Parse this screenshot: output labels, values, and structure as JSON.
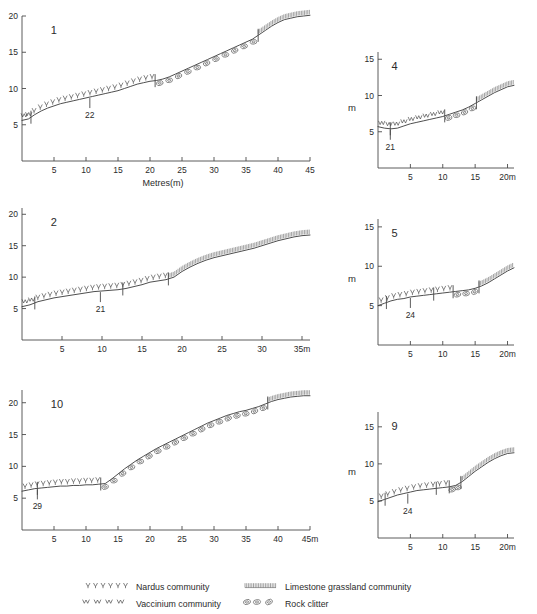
{
  "figure": {
    "axis_title": "Metres(m)",
    "vertical_unit": "m"
  },
  "legend": {
    "items": [
      {
        "symbol": "nardus-symbol",
        "label": "Nardus community"
      },
      {
        "symbol": "vaccinium-symbol",
        "label": "Vaccinium community"
      },
      {
        "symbol": "limestone-symbol",
        "label": "Limestone grassland community"
      },
      {
        "symbol": "clitter-symbol",
        "label": "Rock clitter"
      }
    ]
  },
  "chart_data": {
    "type": "line",
    "xlabel": "Metres(m)",
    "ylabel": "m",
    "grid": false,
    "legend_position": "bottom",
    "panels": [
      {
        "id": "panel-1",
        "number": "1",
        "sample_label": "22",
        "xlim": [
          0,
          45
        ],
        "ylim": [
          0,
          20
        ],
        "xticks": [
          5,
          10,
          15,
          20,
          25,
          30,
          35,
          40,
          45
        ],
        "xtick_labels": [
          "5",
          "10",
          "15",
          "20",
          "25",
          "30",
          "35",
          "40",
          "45"
        ],
        "yticks": [
          5,
          10,
          15,
          20
        ],
        "ytick_labels": [
          "5",
          "10",
          "15",
          "20"
        ],
        "x_axis_title": "Metres(m)",
        "y_unit": "",
        "x": [
          0,
          1,
          2,
          3,
          4,
          5,
          6,
          7,
          8,
          9,
          10,
          11,
          12,
          13,
          14,
          15,
          16,
          17,
          18,
          19,
          20,
          21,
          22,
          23,
          24,
          25,
          26,
          27,
          28,
          29,
          30,
          31,
          32,
          33,
          34,
          35,
          36,
          37,
          38,
          39,
          40,
          41,
          42,
          43,
          44,
          45
        ],
        "y": [
          5.6,
          5.8,
          6.4,
          6.9,
          7.3,
          7.6,
          7.9,
          8.1,
          8.3,
          8.5,
          8.7,
          8.9,
          9.1,
          9.3,
          9.5,
          9.7,
          10.0,
          10.3,
          10.6,
          10.8,
          11.0,
          11.1,
          11.3,
          11.6,
          12.0,
          12.4,
          12.8,
          13.2,
          13.6,
          14.0,
          14.4,
          14.8,
          15.2,
          15.6,
          16.0,
          16.4,
          16.8,
          17.4,
          18.0,
          18.6,
          19.1,
          19.5,
          19.7,
          19.9,
          20.0,
          20.1
        ],
        "segments": [
          {
            "community": "vaccinium",
            "x_start": 0.0,
            "x_end": 1.4
          },
          {
            "community": "nardus",
            "x_start": 1.4,
            "x_end": 20.8
          },
          {
            "community": "clitter",
            "x_start": 20.8,
            "x_end": 36.9
          },
          {
            "community": "limestone",
            "x_start": 36.9,
            "x_end": 45.0
          }
        ],
        "dividers": [
          1.4,
          20.8,
          36.9
        ],
        "sample_marker_x": 10.6
      },
      {
        "id": "panel-4",
        "number": "4",
        "sample_label": "21",
        "xlim": [
          0,
          21
        ],
        "ylim": [
          0,
          16
        ],
        "xticks": [
          5,
          10,
          15,
          20
        ],
        "xtick_labels": [
          "5",
          "10",
          "15",
          "20m"
        ],
        "yticks": [
          5,
          10,
          15
        ],
        "ytick_labels": [
          "5",
          "10",
          "15"
        ],
        "x_axis_title": "",
        "y_unit": "m",
        "x": [
          0,
          1,
          2,
          3,
          4,
          5,
          6,
          7,
          8,
          9,
          10,
          11,
          12,
          13,
          14,
          15,
          16,
          17,
          18,
          19,
          20,
          21
        ],
        "y": [
          5.7,
          5.5,
          5.4,
          5.5,
          5.8,
          6.1,
          6.3,
          6.5,
          6.7,
          6.9,
          7.1,
          7.4,
          7.7,
          8.0,
          8.4,
          8.9,
          9.4,
          9.9,
          10.4,
          10.8,
          11.2,
          11.4
        ],
        "segments": [
          {
            "community": "vaccinium",
            "x_start": 0.0,
            "x_end": 10.3
          },
          {
            "community": "clitter",
            "x_start": 10.3,
            "x_end": 15.2
          },
          {
            "community": "limestone",
            "x_start": 15.2,
            "x_end": 21.0
          }
        ],
        "dividers": [
          1.9,
          10.3,
          15.2
        ],
        "sample_marker_x": 1.9
      },
      {
        "id": "panel-2",
        "number": "2",
        "sample_label": "21",
        "xlim": [
          0,
          36
        ],
        "ylim": [
          0,
          21
        ],
        "xticks": [
          5,
          10,
          15,
          20,
          25,
          30,
          35
        ],
        "xtick_labels": [
          "5",
          "10",
          "15",
          "20",
          "25",
          "30",
          "35m"
        ],
        "yticks": [
          5,
          10,
          15,
          20
        ],
        "ytick_labels": [
          "5",
          "10",
          "15",
          "20"
        ],
        "x_axis_title": "",
        "y_unit": "",
        "x": [
          0,
          1,
          2,
          3,
          4,
          5,
          6,
          7,
          8,
          9,
          10,
          11,
          12,
          13,
          14,
          15,
          16,
          17,
          18,
          19,
          20,
          21,
          22,
          23,
          24,
          25,
          26,
          27,
          28,
          29,
          30,
          31,
          32,
          33,
          34,
          35,
          36
        ],
        "y": [
          5.3,
          5.6,
          6.1,
          6.4,
          6.7,
          6.9,
          7.1,
          7.3,
          7.5,
          7.7,
          7.8,
          7.9,
          8.0,
          8.2,
          8.5,
          8.8,
          9.2,
          9.4,
          9.6,
          10.0,
          10.9,
          11.6,
          12.2,
          12.7,
          13.1,
          13.4,
          13.7,
          14.0,
          14.3,
          14.6,
          15.0,
          15.4,
          15.8,
          16.1,
          16.4,
          16.6,
          16.7
        ],
        "segments": [
          {
            "community": "vaccinium",
            "x_start": 0.0,
            "x_end": 1.6
          },
          {
            "community": "nardus",
            "x_start": 1.6,
            "x_end": 18.3
          },
          {
            "community": "limestone",
            "x_start": 18.3,
            "x_end": 36.0
          }
        ],
        "dividers": [
          1.6,
          12.6,
          18.3
        ],
        "sample_marker_x": 9.8
      },
      {
        "id": "panel-5",
        "number": "5",
        "sample_label": "24",
        "xlim": [
          0,
          21
        ],
        "ylim": [
          0,
          16
        ],
        "xticks": [
          5,
          10,
          15,
          20
        ],
        "xtick_labels": [
          "5",
          "10",
          "15",
          "20m"
        ],
        "yticks": [
          5,
          10,
          15
        ],
        "ytick_labels": [
          "5",
          "10",
          "15"
        ],
        "x_axis_title": "",
        "y_unit": "m",
        "x": [
          0,
          1,
          2,
          3,
          4,
          5,
          6,
          7,
          8,
          9,
          10,
          11,
          12,
          13,
          14,
          15,
          16,
          17,
          18,
          19,
          20,
          21
        ],
        "y": [
          5.0,
          5.3,
          5.6,
          5.8,
          5.9,
          6.1,
          6.2,
          6.3,
          6.4,
          6.5,
          6.6,
          6.7,
          6.8,
          6.9,
          7.0,
          7.2,
          7.5,
          7.9,
          8.4,
          8.9,
          9.4,
          9.8
        ],
        "segments": [
          {
            "community": "nardus",
            "x_start": 0.0,
            "x_end": 11.6
          },
          {
            "community": "clitter",
            "x_start": 11.6,
            "x_end": 15.6
          },
          {
            "community": "limestone",
            "x_start": 15.6,
            "x_end": 21.0
          }
        ],
        "dividers": [
          1.3,
          8.6,
          11.6,
          15.6
        ],
        "sample_marker_x": 5.0
      },
      {
        "id": "panel-10",
        "number": "10",
        "sample_label": "29",
        "xlim": [
          0,
          45
        ],
        "ylim": [
          0,
          22
        ],
        "xticks": [
          5,
          10,
          15,
          20,
          25,
          30,
          35,
          40,
          45
        ],
        "xtick_labels": [
          "5",
          "10",
          "15",
          "20",
          "25",
          "30",
          "35",
          "40",
          "45m"
        ],
        "yticks": [
          5,
          10,
          15,
          20
        ],
        "ytick_labels": [
          "5",
          "10",
          "15",
          "20"
        ],
        "x_axis_title": "",
        "y_unit": "",
        "x": [
          0,
          1,
          2,
          3,
          4,
          5,
          6,
          7,
          8,
          9,
          10,
          11,
          12,
          13,
          14,
          15,
          16,
          17,
          18,
          19,
          20,
          21,
          22,
          23,
          24,
          25,
          26,
          27,
          28,
          29,
          30,
          31,
          32,
          33,
          34,
          35,
          36,
          37,
          38,
          39,
          40,
          41,
          42,
          43,
          44,
          45
        ],
        "y": [
          6.1,
          6.3,
          6.5,
          6.6,
          6.7,
          6.8,
          6.9,
          6.9,
          7.0,
          7.0,
          7.1,
          7.1,
          7.2,
          7.3,
          8.0,
          8.8,
          9.6,
          10.3,
          11.0,
          11.6,
          12.2,
          12.8,
          13.3,
          13.8,
          14.3,
          14.8,
          15.3,
          15.8,
          16.3,
          16.8,
          17.2,
          17.6,
          18.0,
          18.3,
          18.6,
          18.8,
          19.1,
          19.4,
          19.8,
          20.2,
          20.5,
          20.7,
          20.9,
          21.0,
          21.1,
          21.1
        ],
        "segments": [
          {
            "community": "nardus",
            "x_start": 0.0,
            "x_end": 12.3
          },
          {
            "community": "clitter",
            "x_start": 12.3,
            "x_end": 38.4
          },
          {
            "community": "limestone",
            "x_start": 38.4,
            "x_end": 45.0
          }
        ],
        "dividers": [
          2.4,
          12.3,
          38.4
        ],
        "sample_marker_x": 2.4
      },
      {
        "id": "panel-9",
        "number": "9",
        "sample_label": "24",
        "xlim": [
          0,
          21
        ],
        "ylim": [
          0,
          17
        ],
        "xticks": [
          5,
          10,
          15,
          20
        ],
        "xtick_labels": [
          "5",
          "10",
          "15",
          "20m"
        ],
        "yticks": [
          5,
          10,
          15
        ],
        "ytick_labels": [
          "5",
          "10",
          "15"
        ],
        "x_axis_title": "",
        "y_unit": "m",
        "x": [
          0,
          1,
          2,
          3,
          4,
          5,
          6,
          7,
          8,
          9,
          10,
          11,
          12,
          13,
          14,
          15,
          16,
          17,
          18,
          19,
          20,
          21
        ],
        "y": [
          4.9,
          5.2,
          5.5,
          5.8,
          6.0,
          6.2,
          6.4,
          6.5,
          6.6,
          6.7,
          6.8,
          6.9,
          7.1,
          7.6,
          8.3,
          9.0,
          9.6,
          10.2,
          10.7,
          11.1,
          11.4,
          11.5
        ],
        "segments": [
          {
            "community": "nardus",
            "x_start": 0.0,
            "x_end": 11.0
          },
          {
            "community": "clitter",
            "x_start": 11.0,
            "x_end": 12.8
          },
          {
            "community": "limestone",
            "x_start": 12.8,
            "x_end": 21.0
          }
        ],
        "dividers": [
          1.1,
          9.0,
          11.0,
          12.8
        ],
        "sample_marker_x": 4.6
      }
    ]
  }
}
